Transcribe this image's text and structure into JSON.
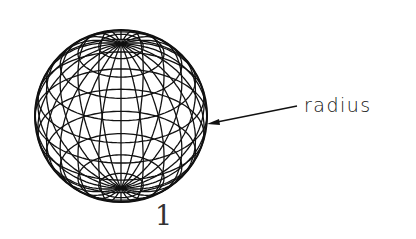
{
  "diagram": {
    "type": "wireframe-sphere",
    "sphere": {
      "cx": 121,
      "cy": 116,
      "r": 86,
      "meridians": 12,
      "parallels": 11,
      "pole_offset": 72,
      "stroke_color": "#111111"
    },
    "annotations": {
      "radius_label": "radius",
      "figure_number": "1"
    },
    "leader": {
      "from": [
        297,
        106
      ],
      "to": [
        208,
        124
      ]
    }
  }
}
